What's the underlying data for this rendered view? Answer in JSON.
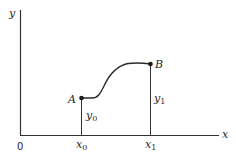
{
  "diagram": {
    "type": "function-graph",
    "axes": {
      "x_label": "x",
      "y_label": "y",
      "origin_label": "0"
    },
    "points": [
      {
        "id": "A",
        "label": "A",
        "x_label": "x",
        "x_sub": "0",
        "y_label": "y",
        "y_sub": "0"
      },
      {
        "id": "B",
        "label": "B",
        "x_label": "x",
        "x_sub": "1",
        "y_label": "y",
        "y_sub": "1"
      }
    ],
    "curve": {
      "description": "smooth increasing curve from A to B, flat near A, S-shaped rise, leveling off near B"
    }
  }
}
